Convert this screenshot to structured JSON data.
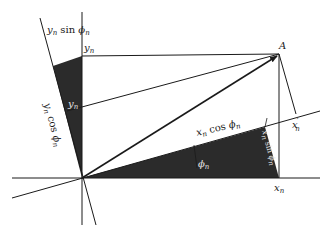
{
  "figure": {
    "type": "coordinate-rotation-diagram",
    "point_label": "A",
    "labels": {
      "y_n_sin_phi_n": {
        "base": "y",
        "sub": "n",
        "fn": " sin ",
        "arg": "ϕ",
        "argsub": "n"
      },
      "y_n": {
        "base": "y",
        "sub": "n"
      },
      "y_n_cos_phi_n": {
        "base": "y",
        "sub": "n",
        "fn": " cos ",
        "arg": "ϕ",
        "argsub": "n"
      },
      "y_prime_n": {
        "base": "y",
        "sup": "′",
        "sub": "n"
      },
      "x_n_cos_phi_n": {
        "base": "x",
        "sub": "n",
        "fn": " cos ",
        "arg": "ϕ",
        "argsub": "n"
      },
      "phi_n": {
        "base": "ϕ",
        "sub": "n"
      },
      "x_n_sin_phi_n": {
        "base": "x",
        "sub": "n",
        "fn": " sin ",
        "arg": "ϕ",
        "argsub": "n"
      },
      "x_prime_n": {
        "base": "x",
        "sup": "′",
        "sub": "n"
      },
      "x_n": {
        "base": "x",
        "sub": "n"
      }
    },
    "colors": {
      "line": "#1a1a1a",
      "shade": "#2b2b2b",
      "background": "#ffffff"
    }
  }
}
